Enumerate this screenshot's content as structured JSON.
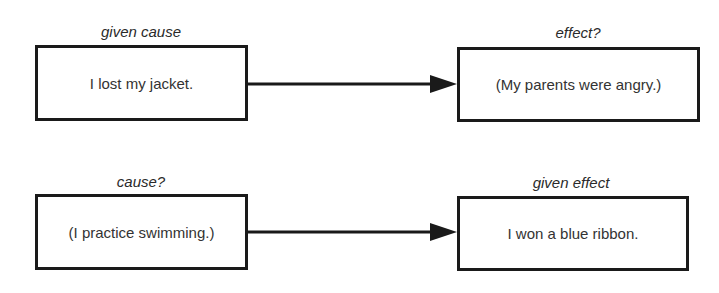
{
  "rows": [
    {
      "left": {
        "label": "given cause",
        "text": "I lost my jacket."
      },
      "right": {
        "label": "effect?",
        "text": "(My parents were angry.)"
      }
    },
    {
      "left": {
        "label": "cause?",
        "text": "(I practice swimming.)"
      },
      "right": {
        "label": "given effect",
        "text": "I won a blue ribbon."
      }
    }
  ],
  "colors": {
    "stroke": "#1a1a1a",
    "text": "#333333"
  }
}
